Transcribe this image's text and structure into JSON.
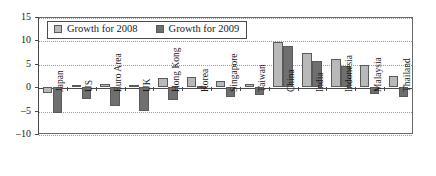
{
  "chart_data": {
    "type": "bar",
    "title": "",
    "subtitle": "",
    "xlabel": "",
    "ylabel": "",
    "ylim": [
      -10,
      15
    ],
    "yticks": [
      15,
      10,
      5,
      0,
      -5,
      -10
    ],
    "ytick_labels": [
      "15",
      "10",
      "5",
      "0",
      "–5",
      "–10"
    ],
    "grid": true,
    "legend_position": "top-left-inside",
    "categories": [
      "Japan",
      "US",
      "Euro Area",
      "UK",
      "Hong Kong",
      "Korea",
      "Singapore",
      "Taiwan",
      "China",
      "India",
      "Indonesia",
      "Malaysia",
      "Thailand"
    ],
    "series": [
      {
        "name": "Growth for 2008",
        "color": "#b9b9b9",
        "values": [
          -1.2,
          0.4,
          0.6,
          0.5,
          2.0,
          2.2,
          1.4,
          0.7,
          9.6,
          7.3,
          6.0,
          4.7,
          2.5
        ]
      },
      {
        "name": "Growth for 2009",
        "color": "#6f6f6f",
        "values": [
          -5.5,
          -2.5,
          -4.0,
          -5.0,
          -2.8,
          0.2,
          -2.0,
          -1.7,
          8.7,
          5.7,
          4.6,
          -1.5,
          -2.2
        ]
      }
    ]
  },
  "legend": {
    "items": [
      {
        "label": "Growth for 2008",
        "color": "#b9b9b9"
      },
      {
        "label": "Growth for 2009",
        "color": "#6f6f6f"
      }
    ]
  },
  "colors": {
    "series_2008": "#b9b9b9",
    "series_2009": "#6f6f6f",
    "axis": "#4a4a4a",
    "grid": "#9a9a9a",
    "background": "#ffffff"
  }
}
